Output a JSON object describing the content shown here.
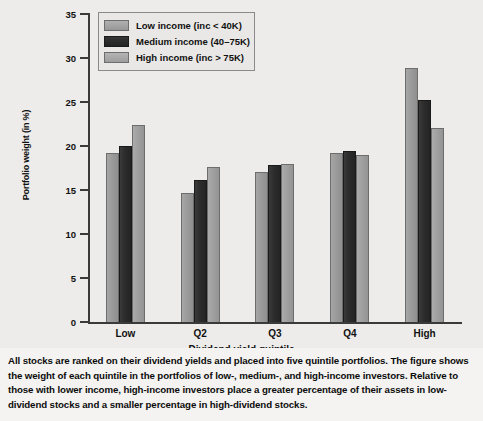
{
  "chart_data": {
    "type": "bar",
    "title": "",
    "xlabel": "Dividend yield quintile",
    "ylabel": "Portfolio weight (in %)",
    "categories": [
      "Low",
      "Q2",
      "Q3",
      "Q4",
      "High"
    ],
    "series": [
      {
        "name": "Low income (inc < 40K)",
        "color": "#9b9b9b",
        "values": [
          19.2,
          14.7,
          17.0,
          19.2,
          28.9
        ]
      },
      {
        "name": "Medium income (40–75K)",
        "color": "#2c2c2c",
        "values": [
          20.0,
          16.1,
          17.8,
          19.4,
          25.2
        ]
      },
      {
        "name": "High income (inc > 75K)",
        "color": "#a0a0a0",
        "values": [
          22.4,
          17.6,
          17.9,
          19.0,
          22.1
        ]
      }
    ],
    "ylim": [
      0,
      35
    ],
    "yticks": [
      0,
      5,
      10,
      15,
      20,
      25,
      30,
      35
    ],
    "grid": false,
    "legend_position": "top-left-inside"
  },
  "legend": {
    "entries": [
      {
        "label": "Low income (inc < 40K)"
      },
      {
        "label": "Medium income (40–75K)"
      },
      {
        "label": "High income (inc > 75K)"
      }
    ]
  },
  "caption": {
    "text": "All stocks are ranked on their dividend yields and placed into five quintile portfolios. The figure shows the weight of each quintile in the portfolios of low-, medium-, and high-income investors. Relative to those with lower income, high-income investors place a greater percentage of their assets in low-dividend stocks and a smaller percentage in high-dividend stocks."
  }
}
